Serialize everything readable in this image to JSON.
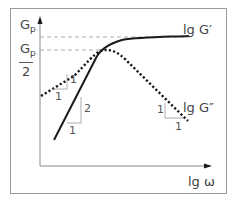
{
  "diagram": {
    "title": "",
    "labels": {
      "gp": "G",
      "gp_sub": "p",
      "gp_half_num": "G",
      "gp_half_sub": "p",
      "gp_half_den": "2",
      "lg_g_prime": "lg G′",
      "lg_g_double_prime": "lg G″",
      "x_axis": "lg ω"
    },
    "slope_triangles": {
      "g_double_prime_low": {
        "rise": "1",
        "run": "1"
      },
      "g_prime_low": {
        "rise": "2",
        "run": "1"
      },
      "g_double_prime_high": {
        "rise": "1",
        "run": "1"
      }
    },
    "colors": {
      "curve": "#1a1a1a",
      "guide": "#999999",
      "text": "#444444",
      "frame": "#9a9a9a"
    }
  }
}
